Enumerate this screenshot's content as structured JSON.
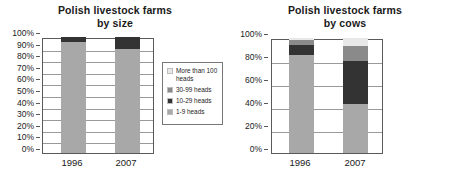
{
  "colors": {
    "seg_1_9": "#a8a8a8",
    "seg_10_29": "#333333",
    "seg_30_99": "#8a8a8a",
    "seg_100plus": "#e8e8e8",
    "axis": "#5a5a5a",
    "grid": "#9a9a9a",
    "text": "#1a1a1a"
  },
  "charts": [
    {
      "id": "by-size",
      "title_line1": "Polish livestock farms",
      "title_line2": "by size",
      "legend": {
        "items": [
          {
            "label": "More than 100 heads",
            "key": "seg_100plus"
          },
          {
            "label": "30-99 heads",
            "key": "seg_30_99"
          },
          {
            "label": "10-29 heads",
            "key": "seg_10_29"
          },
          {
            "label": "1-9 heads",
            "key": "seg_1_9"
          }
        ]
      },
      "chart_data": {
        "type": "bar",
        "subtype": "stacked-percent",
        "title": "Polish livestock farms by size",
        "xlabel": "",
        "ylabel": "",
        "ylim": [
          0,
          100
        ],
        "yticks": [
          "0%",
          "10%",
          "20%",
          "30%",
          "40%",
          "50%",
          "60%",
          "70%",
          "80%",
          "90%",
          "100%"
        ],
        "grid": true,
        "legend_position": "right",
        "categories": [
          "1996",
          "2007"
        ],
        "series": [
          {
            "name": "1-9 heads",
            "values": [
              96,
              90
            ]
          },
          {
            "name": "10-29 heads",
            "values": [
              4,
              10
            ]
          },
          {
            "name": "30-99 heads",
            "values": [
              0,
              0
            ]
          },
          {
            "name": "More than 100 heads",
            "values": [
              0,
              0
            ]
          }
        ]
      }
    },
    {
      "id": "by-cows",
      "title_line1": "Polish livestock farms",
      "title_line2": "by cows",
      "legend": {
        "items": [
          {
            "label": "More than 100 heads",
            "key": "seg_100plus"
          },
          {
            "label": "30-99 heads",
            "key": "seg_30_99"
          },
          {
            "label": "10-29 heads",
            "key": "seg_10_29"
          },
          {
            "label": "1-9 heads",
            "key": "seg_1_9"
          }
        ]
      },
      "chart_data": {
        "type": "bar",
        "subtype": "stacked-percent",
        "title": "Polish livestock farms by cows",
        "xlabel": "",
        "ylabel": "",
        "ylim": [
          0,
          100
        ],
        "yticks": [
          "0%",
          "20%",
          "40%",
          "60%",
          "80%",
          "100%"
        ],
        "grid": true,
        "legend_position": "right",
        "categories": [
          "1996",
          "2007"
        ],
        "series": [
          {
            "name": "1-9 heads",
            "values": [
              85,
              43
            ]
          },
          {
            "name": "10-29 heads",
            "values": [
              9,
              37
            ]
          },
          {
            "name": "30-99 heads",
            "values": [
              4,
              13
            ]
          },
          {
            "name": "More than 100 heads",
            "values": [
              2,
              7
            ]
          }
        ]
      }
    }
  ]
}
